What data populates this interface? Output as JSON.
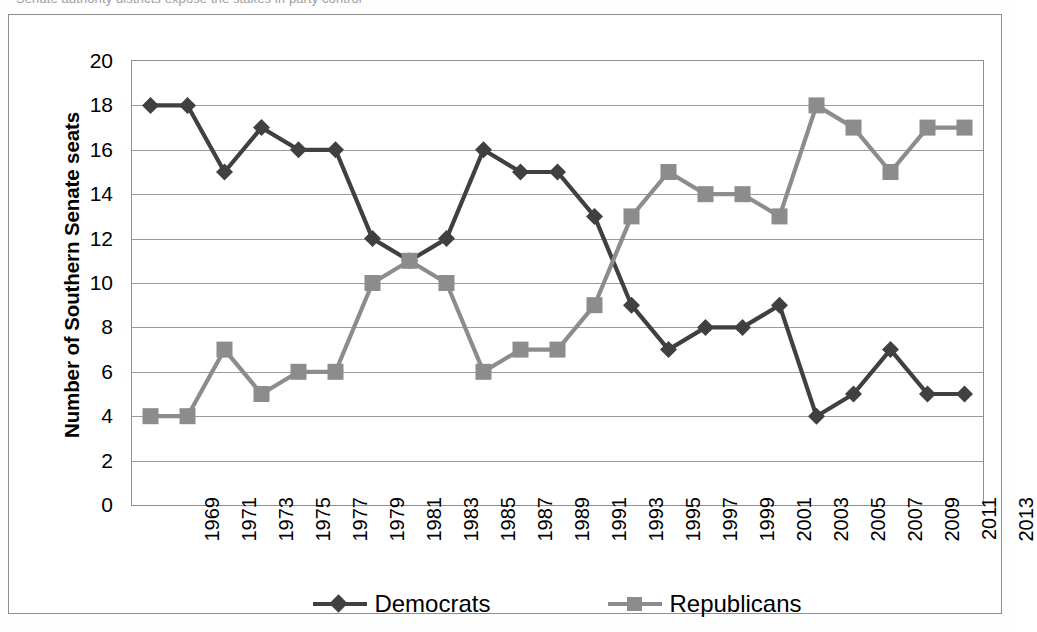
{
  "caption": {
    "cut_off_line": "Senate authority districts expose the stakes in party control"
  },
  "figure": {
    "y_axis_title": "Number of Southern Senate seats"
  },
  "legend": {
    "entries": [
      {
        "label": "Democrats",
        "color": "#404040",
        "marker": "diamond"
      },
      {
        "label": "Republicans",
        "color": "#8c8c8c",
        "marker": "square"
      }
    ]
  },
  "colors": {
    "democrat": "#404040",
    "republican": "#8c8c8c",
    "gridline": "#9a9a9a",
    "frame": "#8e8e8e",
    "background": "#ffffff"
  },
  "chart_data": {
    "type": "line",
    "title": "",
    "xlabel": "",
    "ylabel": "Number of Southern Senate seats",
    "ylim": [
      0,
      20
    ],
    "yticks": [
      0,
      2,
      4,
      6,
      8,
      10,
      12,
      14,
      16,
      18,
      20
    ],
    "grid": true,
    "legend_position": "bottom",
    "categories": [
      "1969",
      "1971",
      "1973",
      "1975",
      "1977",
      "1979",
      "1981",
      "1983",
      "1985",
      "1987",
      "1989",
      "1991",
      "1993",
      "1995",
      "1997",
      "1999",
      "2001",
      "2003",
      "2005",
      "2007",
      "2009",
      "2011",
      "2013"
    ],
    "series": [
      {
        "name": "Democrats",
        "color": "#404040",
        "marker": "diamond",
        "values": [
          18,
          18,
          15,
          17,
          16,
          16,
          12,
          11,
          12,
          16,
          15,
          15,
          13,
          9,
          7,
          8,
          8,
          9,
          4,
          5,
          7,
          5,
          5
        ]
      },
      {
        "name": "Republicans",
        "color": "#8c8c8c",
        "marker": "square",
        "values": [
          4,
          4,
          7,
          5,
          6,
          6,
          10,
          11,
          10,
          6,
          7,
          7,
          9,
          13,
          15,
          14,
          14,
          13,
          18,
          17,
          15,
          17,
          17
        ]
      }
    ]
  }
}
